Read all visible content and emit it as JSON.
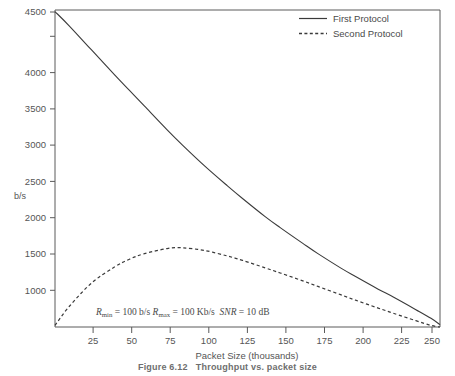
{
  "figure": {
    "caption_label": "Figure 6.12",
    "caption_text": "Throughput vs. packet size"
  },
  "axes": {
    "y_label": "b/s",
    "x_label": "Packet Size (thousands)",
    "y_ticks": [
      "1000",
      "1500",
      "2000",
      "2500",
      "3000",
      "3500",
      "4000",
      "4500"
    ],
    "x_ticks": [
      "25",
      "50",
      "75",
      "100",
      "125",
      "150",
      "175",
      "200",
      "225",
      "250"
    ]
  },
  "legend": {
    "items": [
      {
        "label": "First Protocol",
        "style": "solid"
      },
      {
        "label": "Second Protocol",
        "style": "dashed"
      }
    ]
  },
  "annotation": {
    "rmin_symbol": "R",
    "rmin_sub": "min",
    "rmin_value": "= 100 b/s",
    "rmax_symbol": "R",
    "rmax_sub": "max",
    "rmax_value": "= 100 Kb/s",
    "snr_symbol": "SNR",
    "snr_value": "= 10 dB",
    "full_text": "Rmin = 100 b/s Rmax = 100 Kb/s SNR = 10 dB"
  },
  "colors": {
    "curve": "#3a3a3a",
    "axis": "#5a5a5a",
    "text": "#4a4a4a",
    "background": "#ffffff"
  },
  "chart_data": {
    "type": "line",
    "title": "Throughput vs. packet size",
    "xlabel": "Packet Size (thousands)",
    "ylabel": "b/s",
    "xlim": [
      0.6,
      256
    ],
    "ylim": [
      500,
      4520
    ],
    "grid": false,
    "legend_position": "top-right",
    "x": [
      0.6,
      10,
      25,
      40,
      50,
      60,
      75,
      85,
      100,
      115,
      125,
      140,
      150,
      165,
      175,
      190,
      200,
      215,
      225,
      240,
      250,
      256
    ],
    "series": [
      {
        "name": "First Protocol",
        "style": "solid",
        "values": [
          4500,
          4320,
          4010,
          3700,
          3500,
          3300,
          3000,
          2810,
          2540,
          2290,
          2130,
          1900,
          1760,
          1560,
          1430,
          1250,
          1140,
          980,
          880,
          720,
          610,
          530
        ]
      },
      {
        "name": "Second Protocol",
        "style": "dashed",
        "values": [
          520,
          760,
          1060,
          1260,
          1360,
          1430,
          1495,
          1505,
          1470,
          1400,
          1345,
          1250,
          1185,
          1085,
          1015,
          910,
          840,
          740,
          675,
          580,
          520,
          500
        ]
      }
    ],
    "annotations": [
      {
        "text": "Rmin = 100 b/s  Rmax = 100 Kb/s  SNR = 10 dB",
        "x": 78,
        "y": 620
      }
    ]
  }
}
